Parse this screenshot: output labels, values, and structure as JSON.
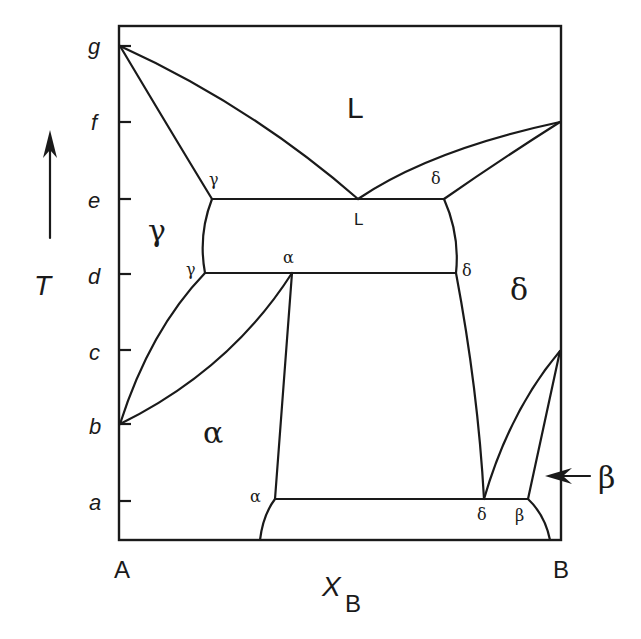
{
  "diagram": {
    "type": "binary-phase-diagram",
    "axes": {
      "y_label": "T",
      "x_label_main": "X",
      "x_label_sub": "B",
      "left_component": "A",
      "right_component": "B",
      "temperature_ticks": [
        "g",
        "f",
        "e",
        "d",
        "c",
        "b",
        "a"
      ]
    },
    "phase_regions": {
      "liquid": "L",
      "gamma": "γ",
      "delta": "δ",
      "alpha": "α"
    },
    "point_labels": {
      "e_gamma": "γ",
      "e_delta": "δ",
      "e_liquid": "L",
      "d_gamma": "γ",
      "d_alpha": "α",
      "d_delta": "δ",
      "a_alpha": "α",
      "a_delta": "δ",
      "a_beta": "β"
    },
    "callout": {
      "label": "β",
      "arrow": "left-arrow"
    },
    "invariant_reactions": [
      {
        "temperature": "e",
        "phases": [
          "γ",
          "L",
          "δ"
        ]
      },
      {
        "temperature": "d",
        "phases": [
          "γ",
          "α",
          "δ"
        ]
      },
      {
        "temperature": "a",
        "phases": [
          "α",
          "δ",
          "β"
        ]
      }
    ],
    "melting_points": {
      "A": "g",
      "B": "f"
    },
    "transformation_points": {
      "A_gamma_to_alpha": "b",
      "B_delta_to_beta": "c"
    }
  }
}
